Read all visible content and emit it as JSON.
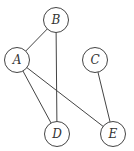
{
  "graph": {
    "type": "undirected",
    "nodes": [
      {
        "id": "A",
        "label": "A",
        "x": 17,
        "y": 60
      },
      {
        "id": "B",
        "label": "B",
        "x": 56,
        "y": 20
      },
      {
        "id": "C",
        "label": "C",
        "x": 95,
        "y": 60
      },
      {
        "id": "D",
        "label": "D",
        "x": 57,
        "y": 134
      },
      {
        "id": "E",
        "label": "E",
        "x": 113,
        "y": 134
      }
    ],
    "edges": [
      {
        "from": "A",
        "to": "B"
      },
      {
        "from": "B",
        "to": "D"
      },
      {
        "from": "A",
        "to": "D"
      },
      {
        "from": "A",
        "to": "E"
      },
      {
        "from": "C",
        "to": "E"
      }
    ],
    "node_radius": 12.5,
    "stroke_color": "#444444"
  }
}
